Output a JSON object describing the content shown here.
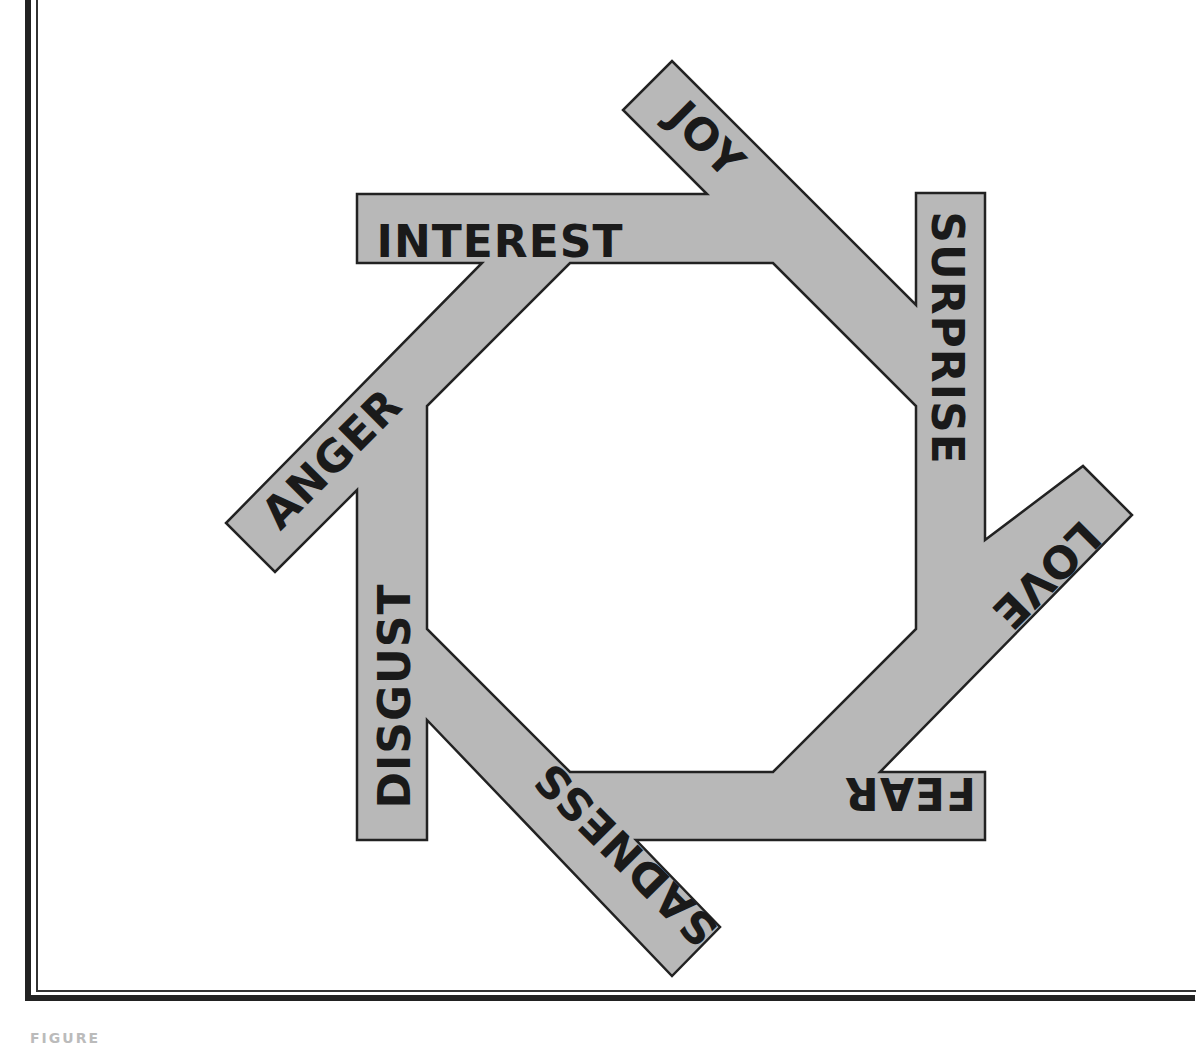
{
  "diagram": {
    "type": "pinwheel-octagon",
    "fill_color": "#b8b8b8",
    "stroke_color": "#222222",
    "background": "#ffffff",
    "emotions": [
      {
        "label": "INTEREST",
        "x": 500,
        "y": 245,
        "angle": 0
      },
      {
        "label": "JOY",
        "x": 704,
        "y": 142,
        "angle": 45
      },
      {
        "label": "SURPRISE",
        "x": 944,
        "y": 338,
        "angle": 90
      },
      {
        "label": "LOVE",
        "x": 1044,
        "y": 573,
        "angle": 135
      },
      {
        "label": "FEAR",
        "x": 910,
        "y": 790,
        "angle": 180
      },
      {
        "label": "SADNESS",
        "x": 628,
        "y": 852,
        "angle": 225
      },
      {
        "label": "DISGUST",
        "x": 398,
        "y": 696,
        "angle": 270
      },
      {
        "label": "ANGER",
        "x": 334,
        "y": 461,
        "angle": 315
      }
    ]
  },
  "caption": "FIGURE"
}
